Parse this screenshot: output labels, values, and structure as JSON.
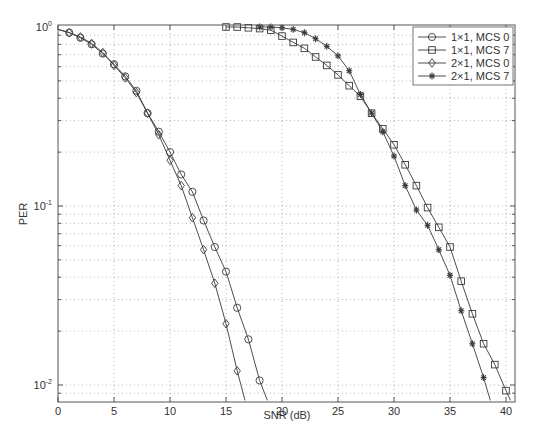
{
  "chart_data": {
    "type": "line",
    "title": "",
    "xlabel": "SNR (dB)",
    "ylabel": "PER",
    "xlim": [
      0,
      40.8
    ],
    "ylim": [
      0.008,
      1.0
    ],
    "yscale": "log",
    "grid": true,
    "legend_position": "upper right",
    "x_ticks": [
      0,
      5,
      10,
      15,
      20,
      25,
      30,
      35,
      40
    ],
    "y_ticks": [
      {
        "value": 1,
        "label_base": "10",
        "label_exp": "0"
      },
      {
        "value": 0.1,
        "label_base": "10",
        "label_exp": "-1"
      },
      {
        "value": 0.01,
        "label_base": "10",
        "label_exp": "-2"
      }
    ],
    "series": [
      {
        "name": "1×1, MCS 0",
        "marker": "circle",
        "x": [
          0,
          1,
          2,
          3,
          4,
          5,
          6,
          7,
          8,
          9,
          10,
          11,
          12,
          13,
          14,
          15,
          16,
          17,
          18,
          18.7
        ],
        "y": [
          0.97,
          0.93,
          0.87,
          0.8,
          0.71,
          0.62,
          0.53,
          0.44,
          0.33,
          0.26,
          0.2,
          0.15,
          0.12,
          0.083,
          0.059,
          0.043,
          0.027,
          0.018,
          0.0106,
          0.0082
        ],
        "marker_points": 19
      },
      {
        "name": "1×1, MCS 7",
        "marker": "square",
        "x": [
          15,
          16,
          17,
          18,
          19,
          20,
          21,
          22,
          23,
          24,
          25,
          26,
          27,
          28,
          29,
          30,
          31,
          32,
          33,
          34,
          35,
          36,
          37,
          38,
          39,
          40,
          40.4
        ],
        "y": [
          1.0,
          1.0,
          0.99,
          0.98,
          0.96,
          0.89,
          0.82,
          0.76,
          0.68,
          0.61,
          0.54,
          0.47,
          0.41,
          0.33,
          0.27,
          0.22,
          0.17,
          0.13,
          0.098,
          0.076,
          0.059,
          0.038,
          0.025,
          0.017,
          0.013,
          0.0093,
          0.0082
        ],
        "marker_points": 26
      },
      {
        "name": "2×1, MCS 0",
        "marker": "diamond",
        "x": [
          0,
          1,
          2,
          3,
          4,
          5,
          6,
          7,
          8,
          9,
          10,
          11,
          12,
          13,
          14,
          15,
          16,
          16.7
        ],
        "y": [
          0.97,
          0.93,
          0.88,
          0.81,
          0.72,
          0.61,
          0.52,
          0.43,
          0.33,
          0.25,
          0.18,
          0.13,
          0.086,
          0.057,
          0.037,
          0.022,
          0.012,
          0.0082
        ],
        "marker_points": 17
      },
      {
        "name": "2×1, MCS 7",
        "marker": "star",
        "x": [
          18,
          19,
          20,
          21,
          22,
          23,
          24,
          25,
          26,
          27,
          28,
          29,
          30,
          31,
          32,
          33,
          34,
          35,
          36,
          37,
          38,
          38.6
        ],
        "y": [
          1.0,
          1.0,
          0.99,
          0.97,
          0.93,
          0.86,
          0.78,
          0.69,
          0.57,
          0.42,
          0.33,
          0.26,
          0.19,
          0.13,
          0.095,
          0.078,
          0.057,
          0.041,
          0.026,
          0.017,
          0.011,
          0.0082
        ],
        "marker_points": 21
      }
    ]
  },
  "colors": {
    "line": "#3a3a3a",
    "axis": "#555555",
    "grid": "#9a9a9a",
    "background": "#ffffff"
  }
}
